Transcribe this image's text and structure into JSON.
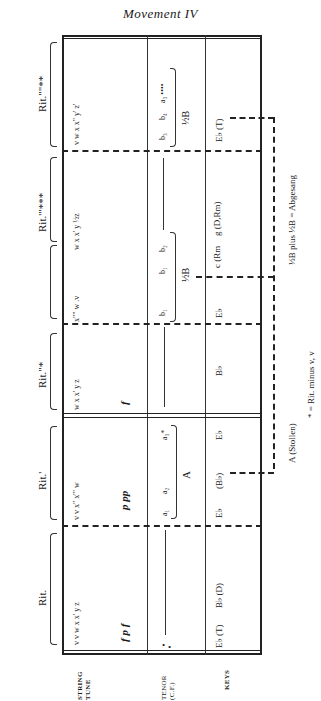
{
  "title": "Movement IV",
  "row_labels": {
    "string_tune": [
      "STRING",
      "TUNE"
    ],
    "tenor": [
      "TENOR",
      "(C.F.)"
    ],
    "keys": "KEYS"
  },
  "sections": [
    {
      "rit_label": "Rit.",
      "string_seq": "v  v  w  x  x'  y  z",
      "dynamics": "f  p  f",
      "tenor": "",
      "keys": [
        "E♭ (T)",
        "B♭ (D)"
      ]
    },
    {
      "rit_label": "Rit.'",
      "string_seq": "v  v  x\"  x'\"  w",
      "dynamics": "p  pp",
      "tenor": [
        "a₁",
        "a₂",
        "a₃*"
      ],
      "tenor_group_label": "A",
      "keys": [
        "E♭",
        "(B♭)",
        "E♭"
      ]
    },
    {
      "rit_label": "Rit.\"*",
      "string_seq": "w  x  x'  y  z",
      "dynamics": "f",
      "tenor": "",
      "keys": [
        "B♭"
      ]
    },
    {
      "rit_label": "",
      "string_seq": "x\"\"  w  .v",
      "tenor": [
        "b₁",
        "b₁",
        "b₂"
      ],
      "tenor_group_label": "½B",
      "keys": [
        "E♭"
      ]
    },
    {
      "rit_label": "Rit.'\"***",
      "string_seq": "w  x  x'  y  ½z",
      "tenor": "",
      "keys": [
        "c (Rm",
        "g (D,Rm)"
      ]
    },
    {
      "rit_label": "Rit.\"\"**",
      "string_seq": "v  w  x  x\"  y'  z'",
      "tenor": [
        "b₃",
        "b₄",
        "a₃ ••••"
      ],
      "tenor_group_label": "½B",
      "keys": [
        "E♭ (T)"
      ]
    }
  ],
  "annotations": {
    "stollen": "A (Stollen)",
    "abgesang": "½B plus ½B = Abgesang",
    "footnote": "* = Rit. minus v, v"
  }
}
